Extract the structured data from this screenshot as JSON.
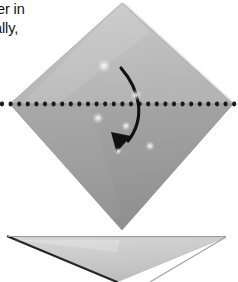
{
  "figure": {
    "kind": "origami-fold-diagram",
    "background_color": "#ffffff"
  },
  "text_fragments": {
    "line1": "per in",
    "line2": "ally,"
  },
  "shapes": {
    "diamond": {
      "name": "folded-paper-diamond",
      "description": "Square sheet rotated 45 degrees (diamond) spanning the frame",
      "top_vertex": [
        122,
        3
      ],
      "right_vertex": [
        233,
        104
      ],
      "bottom_vertex": [
        122,
        230
      ],
      "left_vertex": [
        10,
        104
      ],
      "upper_half_color": "#bfbfbf",
      "lower_half_color": "#9a9a9a",
      "edge_color": "#8e8e8e"
    },
    "lower_triangle": {
      "name": "result-folded-triangle",
      "description": "Downward pointing triangle showing the result of the fold",
      "left_vertex": [
        8,
        237
      ],
      "right_vertex": [
        226,
        237
      ],
      "bottom_vertex": [
        117,
        282
      ],
      "fill_color": "#cdcdcd",
      "edge_color": "#2a2a2a"
    },
    "fold_line": {
      "name": "horizontal-fold-dotted-line",
      "description": "Horizontal dotted crease line across the diamond",
      "y": 104,
      "x_start": 2,
      "x_end": 238,
      "dot_color": "#1a1a1a",
      "dot_radius": 2.1,
      "dot_spacing": 8.6
    },
    "fold_arrow": {
      "name": "fold-direction-arrow",
      "description": "Curved arrow showing the top half folding down over the bottom half",
      "start": [
        121,
        68
      ],
      "end": [
        117,
        151
      ],
      "color": "#111111",
      "stroke_width": 3.1
    }
  },
  "highlights": [
    {
      "x": 104,
      "y": 66,
      "size": 7
    },
    {
      "x": 136,
      "y": 95,
      "size": 6
    },
    {
      "x": 98,
      "y": 118,
      "size": 6
    },
    {
      "x": 126,
      "y": 126,
      "size": 5
    },
    {
      "x": 150,
      "y": 146,
      "size": 5
    },
    {
      "x": 118,
      "y": 151,
      "size": 4
    }
  ]
}
